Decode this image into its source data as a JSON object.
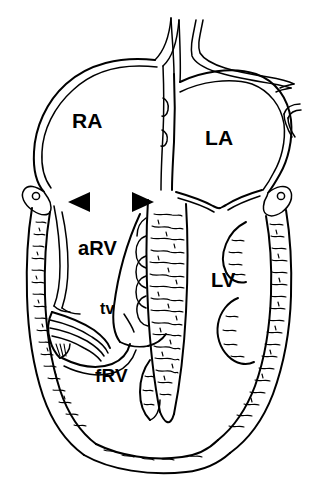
{
  "figure": {
    "kind": "anatomical-line-drawing",
    "background_color": "#ffffff",
    "stroke_color": "#000000"
  },
  "labels": {
    "right_atrium": "RA",
    "left_atrium": "LA",
    "atrialized_right_ventricle": "aRV",
    "left_ventricle": "LV",
    "functional_right_ventricle": "fRV",
    "tricuspid_valve": "tv"
  },
  "markers": {
    "arrowhead_left": "◀",
    "arrowhead_right": "▶",
    "count": 2,
    "color": "#000000"
  },
  "structures": [
    "superior-vena-cava",
    "pulmonary-veins",
    "right-atrial-free-wall",
    "left-atrial-free-wall",
    "interatrial-septum",
    "interventricular-septum",
    "right-ventricular-free-wall",
    "left-ventricular-free-wall",
    "mitral-valve-leaflets",
    "displaced-tricuspid-valve-leaflet",
    "tricuspid-valve-anterior-leaflet",
    "right-coronary-artery",
    "left-circumflex-artery",
    "cardiac-apex",
    "papillary-muscles",
    "trabeculated-myocardium"
  ]
}
